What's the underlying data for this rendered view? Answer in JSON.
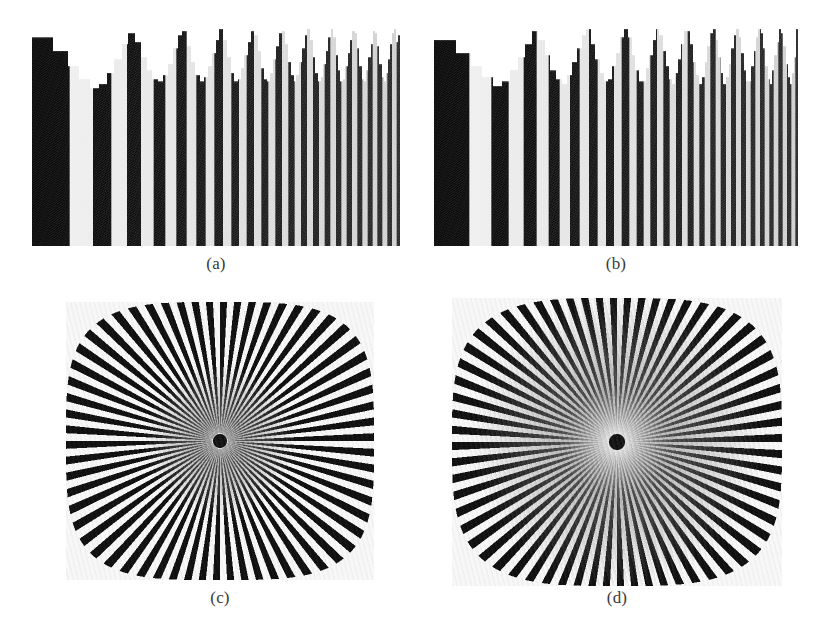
{
  "figure": {
    "background_color": "#ffffff",
    "ink_color": "#1a1a1a",
    "width": 823,
    "height": 640
  },
  "panels": [
    {
      "id": "a",
      "caption": "(a)",
      "kind": "chirp-bar-pattern",
      "description": "Vertical bar frequency sweep with aliasing",
      "x": 32,
      "y": 26,
      "width": 368,
      "height": 220
    },
    {
      "id": "b",
      "caption": "(b)",
      "kind": "chirp-bar-pattern",
      "description": "Vertical bar frequency sweep sampled at a different rate",
      "x": 434,
      "y": 26,
      "width": 364,
      "height": 220
    },
    {
      "id": "c",
      "caption": "(c)",
      "kind": "radial-spoke-star",
      "description": "Siemens star resolution chart with central moire",
      "x": 66,
      "y": 302,
      "width": 308,
      "height": 278
    },
    {
      "id": "d",
      "caption": "(d)",
      "kind": "radial-spoke-star",
      "description": "Siemens star resolution chart with larger aliasing halo",
      "x": 452,
      "y": 298,
      "width": 330,
      "height": 288
    }
  ],
  "chart_data": [
    {
      "type": "bar",
      "id": "a",
      "title": "(a)",
      "xlabel": "",
      "ylabel": "",
      "grid": false,
      "legend": "none",
      "bar_count": 96,
      "sampling_period": 0.955,
      "chirp_start_frequency": 0.0085,
      "chirp_end_frequency": 0.118,
      "beat_amplitude": 0.2,
      "height_base": 0.8,
      "xlim": [
        0,
        368
      ],
      "ylim": [
        0,
        1
      ],
      "categories": [
        1,
        2,
        3,
        4,
        5,
        6,
        7,
        8,
        9,
        10,
        11,
        12,
        13,
        14,
        15,
        16,
        17,
        18,
        19,
        20,
        21,
        22,
        23,
        24,
        25,
        26,
        27,
        28,
        29,
        30,
        31,
        32,
        33,
        34,
        35,
        36,
        37,
        38,
        39,
        40,
        41,
        42,
        43,
        44,
        45,
        46,
        47,
        48,
        49,
        50,
        51,
        52,
        53,
        54,
        55,
        56,
        57,
        58,
        59,
        60,
        61,
        62,
        63,
        64,
        65,
        66,
        67,
        68,
        69,
        70,
        71,
        72,
        73,
        74,
        75,
        76,
        77,
        78,
        79,
        80,
        81,
        82,
        83,
        84,
        85,
        86,
        87,
        88,
        89,
        90,
        91,
        92,
        93,
        94,
        95,
        96
      ],
      "values": [
        0.95,
        0.89,
        0.82,
        0.76,
        0.72,
        0.74,
        0.79,
        0.85,
        0.92,
        0.97,
        0.93,
        0.86,
        0.8,
        0.76,
        0.75,
        0.78,
        0.83,
        0.9,
        0.96,
        0.98,
        0.91,
        0.84,
        0.78,
        0.75,
        0.77,
        0.82,
        0.88,
        0.94,
        0.99,
        0.94,
        0.86,
        0.79,
        0.75,
        0.76,
        0.81,
        0.87,
        0.93,
        0.98,
        0.96,
        0.89,
        0.81,
        0.76,
        0.75,
        0.79,
        0.85,
        0.91,
        0.97,
        0.98,
        0.92,
        0.84,
        0.78,
        0.75,
        0.78,
        0.84,
        0.9,
        0.96,
        0.99,
        0.94,
        0.86,
        0.79,
        0.75,
        0.77,
        0.83,
        0.89,
        0.95,
        0.99,
        0.95,
        0.87,
        0.8,
        0.75,
        0.76,
        0.82,
        0.88,
        0.94,
        0.98,
        0.97,
        0.9,
        0.82,
        0.76,
        0.75,
        0.8,
        0.86,
        0.92,
        0.98,
        0.97,
        0.91,
        0.83,
        0.77,
        0.75,
        0.79,
        0.85,
        0.92,
        0.97,
        0.99,
        0.93,
        0.96
      ]
    },
    {
      "type": "bar",
      "id": "b",
      "title": "(b)",
      "xlabel": "",
      "ylabel": "",
      "grid": false,
      "legend": "none",
      "bar_count": 92,
      "sampling_period": 0.972,
      "chirp_start_frequency": 0.009,
      "chirp_end_frequency": 0.126,
      "beat_amplitude": 0.22,
      "height_base": 0.78,
      "xlim": [
        0,
        364
      ],
      "ylim": [
        0,
        1
      ],
      "categories": [
        1,
        2,
        3,
        4,
        5,
        6,
        7,
        8,
        9,
        10,
        11,
        12,
        13,
        14,
        15,
        16,
        17,
        18,
        19,
        20,
        21,
        22,
        23,
        24,
        25,
        26,
        27,
        28,
        29,
        30,
        31,
        32,
        33,
        34,
        35,
        36,
        37,
        38,
        39,
        40,
        41,
        42,
        43,
        44,
        45,
        46,
        47,
        48,
        49,
        50,
        51,
        52,
        53,
        54,
        55,
        56,
        57,
        58,
        59,
        60,
        61,
        62,
        63,
        64,
        65,
        66,
        67,
        68,
        69,
        70,
        71,
        72,
        73,
        74,
        75,
        76,
        77,
        78,
        79,
        80,
        81,
        82,
        83,
        84,
        85,
        86,
        87,
        88,
        89,
        90,
        91,
        92
      ],
      "values": [
        0.94,
        0.88,
        0.82,
        0.77,
        0.73,
        0.75,
        0.8,
        0.86,
        0.92,
        0.98,
        0.94,
        0.87,
        0.8,
        0.76,
        0.74,
        0.78,
        0.84,
        0.9,
        0.96,
        0.99,
        0.92,
        0.85,
        0.79,
        0.75,
        0.76,
        0.82,
        0.88,
        0.95,
        0.99,
        0.95,
        0.87,
        0.8,
        0.75,
        0.75,
        0.81,
        0.87,
        0.94,
        0.99,
        0.96,
        0.89,
        0.82,
        0.76,
        0.74,
        0.79,
        0.85,
        0.92,
        0.98,
        0.98,
        0.92,
        0.84,
        0.78,
        0.74,
        0.77,
        0.84,
        0.91,
        0.97,
        0.99,
        0.94,
        0.86,
        0.79,
        0.74,
        0.77,
        0.83,
        0.9,
        0.96,
        0.99,
        0.95,
        0.88,
        0.8,
        0.75,
        0.75,
        0.82,
        0.89,
        0.95,
        0.99,
        0.97,
        0.9,
        0.82,
        0.76,
        0.74,
        0.8,
        0.87,
        0.93,
        0.99,
        0.97,
        0.91,
        0.83,
        0.77,
        0.74,
        0.79,
        0.86,
        0.99
      ]
    },
    {
      "type": "radial",
      "id": "c",
      "title": "(c)",
      "spoke_count": 124,
      "outer_shape": "superellipse",
      "superellipse_exponent": 3.6,
      "radius_x": 154,
      "radius_y": 139,
      "hub_radius": 6.5,
      "halo_radius": 26,
      "halo_strength": 0.55,
      "moire_radius": 78,
      "ink_color": "#1a1a1a",
      "background_color": "#ffffff"
    },
    {
      "type": "radial",
      "id": "d",
      "title": "(d)",
      "spoke_count": 128,
      "outer_shape": "superellipse",
      "superellipse_exponent": 3.4,
      "radius_x": 165,
      "radius_y": 144,
      "hub_radius": 7.5,
      "halo_radius": 58,
      "halo_strength": 1.0,
      "moire_radius": 150,
      "ink_color": "#1a1a1a",
      "background_color": "#ffffff"
    }
  ]
}
